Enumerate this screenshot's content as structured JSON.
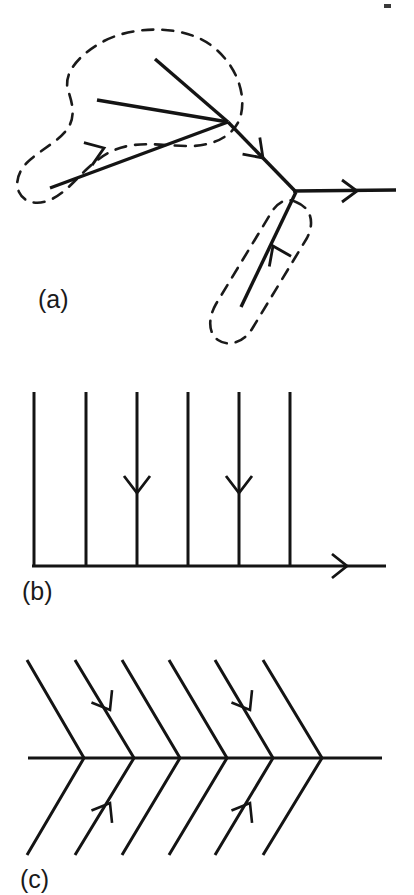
{
  "figure": {
    "background_color": "#ffffff",
    "ink_color": "#141414",
    "dash_color": "#1a1a1a",
    "width": 414,
    "height": 895,
    "panels": [
      {
        "id": "a",
        "label": "(a)",
        "label_x": 38,
        "label_y": 308,
        "description": "branching curve with dashed enclosing regions",
        "stroke_width": 3.4,
        "arrow_stroke_width": 2.6,
        "segments": [
          {
            "name": "upper-left-long-branch",
            "x1": 50,
            "y1": 188,
            "x2": 228,
            "y2": 122
          },
          {
            "name": "upper-left-short-branch",
            "x1": 97,
            "y1": 100,
            "x2": 228,
            "y2": 122
          },
          {
            "name": "upper-right-diagonal-branch",
            "x1": 155,
            "y1": 59,
            "x2": 228,
            "y2": 122
          },
          {
            "name": "mid-diagonal-trunk",
            "x1": 228,
            "y1": 122,
            "x2": 296,
            "y2": 192
          },
          {
            "name": "lower-branch",
            "x1": 296,
            "y1": 192,
            "x2": 241,
            "y2": 307
          },
          {
            "name": "horizontal-outflow",
            "x1": 296,
            "y1": 192,
            "x2": 396,
            "y2": 190
          }
        ],
        "arrows": [
          {
            "name": "arrow-upper-left-branch",
            "x": 104,
            "y": 148,
            "angle": -20,
            "direction": "up-right"
          },
          {
            "name": "arrow-mid-trunk",
            "x": 262,
            "y": 157,
            "angle": 46,
            "direction": "down-right"
          },
          {
            "name": "arrow-horizontal-outflow",
            "x": 355,
            "y": 191,
            "angle": 0,
            "direction": "right"
          },
          {
            "name": "arrow-lower-branch",
            "x": 271,
            "y": 250,
            "angle": -115,
            "direction": "up-right"
          }
        ],
        "dashed_regions": [
          {
            "name": "dashed-region-upper-blob",
            "shape": "kidney-blob"
          },
          {
            "name": "dashed-region-lower-capsule",
            "shape": "capsule"
          }
        ]
      },
      {
        "id": "b",
        "label": "(b)",
        "label_x": 22,
        "label_y": 600,
        "description": "parallel vertical lines meeting a horizontal baseline with outflow arrow",
        "stroke_width": 3.0,
        "arrow_stroke_width": 2.6,
        "baseline": {
          "name": "baseline",
          "x1": 32,
          "y1": 566,
          "x2": 386,
          "y2": 566
        },
        "vertical_lines": [
          {
            "name": "vertical-line-1",
            "x": 34,
            "y_top": 392,
            "y_bottom": 566,
            "has_arrow": false
          },
          {
            "name": "vertical-line-2",
            "x": 86,
            "y_top": 392,
            "y_bottom": 566,
            "has_arrow": false
          },
          {
            "name": "vertical-line-3",
            "x": 137,
            "y_top": 392,
            "y_bottom": 566,
            "has_arrow": true
          },
          {
            "name": "vertical-line-4",
            "x": 188,
            "y_top": 392,
            "y_bottom": 566,
            "has_arrow": false
          },
          {
            "name": "vertical-line-5",
            "x": 239,
            "y_top": 392,
            "y_bottom": 566,
            "has_arrow": true
          },
          {
            "name": "vertical-line-6",
            "x": 290,
            "y_top": 392,
            "y_bottom": 566,
            "has_arrow": false
          }
        ],
        "arrows": [
          {
            "name": "arrow-vertical-line-3",
            "x": 137,
            "y": 490,
            "angle": 90,
            "direction": "down"
          },
          {
            "name": "arrow-vertical-line-5",
            "x": 239,
            "y": 490,
            "angle": 90,
            "direction": "down"
          },
          {
            "name": "arrow-baseline-outflow",
            "x": 345,
            "y": 566,
            "angle": 0,
            "direction": "right"
          }
        ]
      },
      {
        "id": "c",
        "label": "(c)",
        "label_x": 20,
        "label_y": 888,
        "description": "herringbone chevron pattern on a horizontal axis",
        "stroke_width": 3.0,
        "arrow_stroke_width": 2.6,
        "axis": {
          "name": "axis",
          "x1": 28,
          "y1": 758,
          "x2": 382,
          "y2": 758
        },
        "chevrons": [
          {
            "name": "chevron-1",
            "apex_x": 84,
            "upper_x": 27,
            "lower_x": 27,
            "has_arrows": false
          },
          {
            "name": "chevron-2",
            "apex_x": 134,
            "upper_x": 75,
            "lower_x": 75,
            "has_arrows": true
          },
          {
            "name": "chevron-3",
            "apex_x": 180,
            "upper_x": 122,
            "lower_x": 122,
            "has_arrows": false
          },
          {
            "name": "chevron-4",
            "apex_x": 227,
            "upper_x": 169,
            "lower_x": 169,
            "has_arrows": false
          },
          {
            "name": "chevron-5",
            "apex_x": 273,
            "upper_x": 215,
            "lower_x": 215,
            "has_arrows": true
          },
          {
            "name": "chevron-6",
            "apex_x": 322,
            "upper_x": 263,
            "lower_x": 263,
            "has_arrows": false
          }
        ],
        "chevron_top_y": 660,
        "chevron_bottom_y": 855,
        "arrows": [
          {
            "name": "arrow-chevron-2-upper",
            "x": 108,
            "y": 708,
            "angle": 60,
            "direction": "down-right"
          },
          {
            "name": "arrow-chevron-2-lower",
            "x": 108,
            "y": 805,
            "angle": -60,
            "direction": "up-right"
          },
          {
            "name": "arrow-chevron-5-upper",
            "x": 248,
            "y": 708,
            "angle": 60,
            "direction": "down-right"
          },
          {
            "name": "arrow-chevron-5-lower",
            "x": 248,
            "y": 805,
            "angle": -60,
            "direction": "up-right"
          }
        ]
      }
    ],
    "artifacts": [
      {
        "name": "scan-speck",
        "x": 384,
        "y": 4,
        "width": 7,
        "height": 4
      }
    ]
  }
}
